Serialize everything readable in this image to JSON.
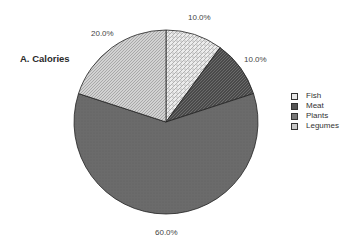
{
  "panel": {
    "title": "A.  Calories"
  },
  "legend": {
    "items": [
      {
        "label": "Fish",
        "pattern": "dots"
      },
      {
        "label": "Meat",
        "pattern": "dark-hatch"
      },
      {
        "label": "Plants",
        "pattern": "solid-gray"
      },
      {
        "label": "Legumes",
        "pattern": "light-hatch"
      }
    ]
  },
  "slice_labels": [
    "10.0%",
    "10.0%",
    "60.0%",
    "20.0%"
  ],
  "chart_data": {
    "type": "pie",
    "title": "A.  Calories",
    "categories": [
      "Fish",
      "Meat",
      "Plants",
      "Legumes"
    ],
    "values": [
      10.0,
      10.0,
      60.0,
      20.0
    ],
    "value_labels": [
      "10.0%",
      "10.0%",
      "60.0%",
      "20.0%"
    ],
    "start_angle": "12 o'clock",
    "direction": "clockwise",
    "legend_position": "right",
    "colors": {
      "fish": "#e6e6e6",
      "meat": "#555555",
      "plants": "#6e6e6e",
      "legumes": "#c4c4c4",
      "outline": "#222222"
    }
  }
}
